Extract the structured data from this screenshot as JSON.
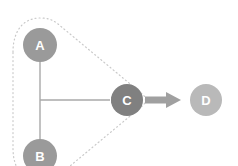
{
  "diagram": {
    "type": "node-link-graph",
    "background_color": "#ffffff",
    "nodes": [
      {
        "id": "A",
        "label": "A",
        "cx": 40,
        "cy": 45,
        "r": 17,
        "fill": "#9a9a9a",
        "label_color": "#ffffff",
        "label_size": 13
      },
      {
        "id": "B",
        "label": "B",
        "cx": 40,
        "cy": 156,
        "r": 17,
        "fill": "#9a9a9a",
        "label_color": "#ffffff",
        "label_size": 13
      },
      {
        "id": "C",
        "label": "C",
        "cx": 127,
        "cy": 100,
        "r": 16,
        "fill": "#808080",
        "label_color": "#ffffff",
        "label_size": 13
      },
      {
        "id": "D",
        "label": "D",
        "cx": 206,
        "cy": 100,
        "r": 16,
        "fill": "#b9b9b9",
        "label_color": "#ffffff",
        "label_size": 13
      }
    ],
    "edges": [
      {
        "id": "a-to-b-trunk",
        "from": "A",
        "to": "B",
        "style": "thin-line",
        "color": "#a8a8a8",
        "width": 1.4,
        "arrow": false
      },
      {
        "id": "trunk-to-c",
        "from": "trunk",
        "to": "C",
        "style": "thin-line-arrow",
        "color": "#a8a8a8",
        "width": 1.4,
        "arrow": true
      },
      {
        "id": "c-to-d",
        "from": "C",
        "to": "D",
        "style": "thick-block-arrow",
        "color": "#a0a0a0",
        "width": 7,
        "arrow": true
      }
    ],
    "group_boundary": {
      "id": "cluster-abc",
      "style": "dotted",
      "color": "#c9c9c9",
      "stroke_width": 1.2,
      "dash": "1 3",
      "members": [
        "A",
        "B",
        "C"
      ],
      "shape": "rounded-triangle"
    }
  }
}
